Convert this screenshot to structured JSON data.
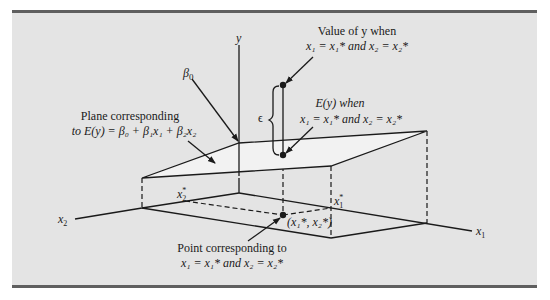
{
  "figure": {
    "axes": {
      "y_label": "y",
      "x1_label": "x",
      "x1_sub": "1",
      "x2_label": "x",
      "x2_sub": "2"
    },
    "ticks": {
      "x1_star": "x",
      "x1_star_sub": "1",
      "x2_star": "x",
      "x2_star_sub": "2",
      "star": "*"
    },
    "annotations": {
      "beta0": "β",
      "beta0_sub": "0",
      "value_of_y_line1": "Value of y when",
      "value_of_y_line2": "x₁ = x₁* and x₂ = x₂*",
      "ey_line1": "E(y) when",
      "ey_line2": "x₁ = x₁* and x₂ = x₂*",
      "plane_line1": "Plane corresponding",
      "plane_line2": "to E(y) = β₀ + β₁x₁ + β₂x₂",
      "epsilon": "ϵ",
      "point_line1": "Point corresponding to",
      "point_line2": "x₁ = x₁* and x₂ = x₂*",
      "point_coords": "(x₁*, x₂*)"
    }
  }
}
